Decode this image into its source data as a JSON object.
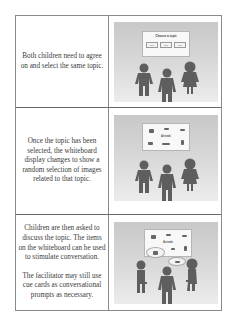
{
  "rows": [
    {
      "text": [
        "Both children need to agree on and select the same topic."
      ],
      "scene": {
        "board_title": "Choose a topic",
        "topic_buttons": [
          "topic",
          "topic",
          "topic"
        ],
        "people": [
          "child-left",
          "facilitator",
          "child-right"
        ]
      }
    },
    {
      "text": [
        "Once the topic has been selected, the whiteboard display changes to show a random selection of images related to that topic."
      ],
      "scene": {
        "board_label": "Animals",
        "people": [
          "child-left",
          "facilitator",
          "child-right"
        ]
      }
    },
    {
      "text": [
        "Children are then asked to discuss the topic. The items on the whiteboard can be used to stimulate conversation.",
        "The facilitator may still use cue cards as conversational prompts as necessary."
      ],
      "scene": {
        "board_label": "Animals",
        "people": [
          "child-left",
          "facilitator",
          "child-right"
        ],
        "speech_bubbles": 2
      }
    }
  ],
  "colors": {
    "border": "#8a8a8a",
    "figure": "#5e5e5e",
    "scene_bg": "#d4d4d4",
    "text": "#3a3a3a"
  }
}
